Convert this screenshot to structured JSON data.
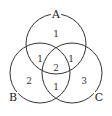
{
  "diagram": {
    "type": "venn",
    "sets": [
      {
        "name": "A",
        "cx": 56,
        "cy": 44,
        "r": 30,
        "label_x": 56,
        "label_y": 18
      },
      {
        "name": "B",
        "cx": 40,
        "cy": 73,
        "r": 30,
        "label_x": 13,
        "label_y": 101
      },
      {
        "name": "C",
        "cx": 72,
        "cy": 73,
        "r": 30,
        "label_x": 99,
        "label_y": 101
      }
    ],
    "regions": [
      {
        "id": "A-only",
        "value": "1",
        "x": 56,
        "y": 37
      },
      {
        "id": "A-B",
        "value": "1",
        "x": 40,
        "y": 62
      },
      {
        "id": "A-C",
        "value": "1",
        "x": 71,
        "y": 62
      },
      {
        "id": "A-B-C",
        "value": "2",
        "x": 56,
        "y": 71
      },
      {
        "id": "B-only",
        "value": "2",
        "x": 29,
        "y": 84
      },
      {
        "id": "B-C",
        "value": "1",
        "x": 56,
        "y": 90
      },
      {
        "id": "C-only",
        "value": "3",
        "x": 84,
        "y": 84
      }
    ]
  }
}
